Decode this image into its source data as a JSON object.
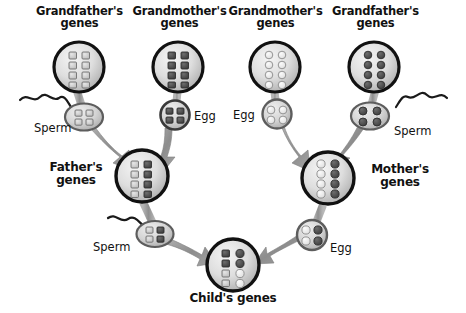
{
  "diagram": {
    "canvas": {
      "width": 466,
      "height": 313
    },
    "palette": {
      "background": "#ffffff",
      "text": "#111111",
      "cell_outline": "#111111",
      "cell_fill_light": "#d8d8d8",
      "cell_fill_mid": "#c2c2c2",
      "arrow_gray": "#9a9a9a",
      "arrow_gray_dark": "#7e7e7e",
      "gene_light": "#cccccc",
      "gene_dark": "#555555",
      "gene_white": "#f2f2f2",
      "gene_outline": "#6e6e6e",
      "tail_black": "#1a1a1a"
    }
  },
  "labels": {
    "paternal_grandfather": "Grandfather's\ngenes",
    "paternal_grandmother": "Grandmother's\ngenes",
    "maternal_grandmother": "Grandmother's\ngenes",
    "maternal_grandfather": "Grandfather's\ngenes",
    "father": "Father's\ngenes",
    "mother": "Mother's\ngenes",
    "child": "Child's genes",
    "sperm_paternal": "Sperm",
    "egg_paternal": "Egg",
    "egg_maternal": "Egg",
    "sperm_maternal": "Sperm",
    "sperm_father": "Sperm",
    "egg_mother": "Egg"
  },
  "cells": {
    "paternal_grandfather": {
      "name": "paternal-grandfather-cell",
      "shape": "square",
      "rows": 4,
      "cols": 2,
      "genes": [
        [
          "light",
          "light"
        ],
        [
          "light",
          "light"
        ],
        [
          "light",
          "light"
        ],
        [
          "light",
          "light"
        ]
      ]
    },
    "paternal_grandmother": {
      "name": "paternal-grandmother-cell",
      "shape": "square",
      "rows": 4,
      "cols": 2,
      "genes": [
        [
          "dark",
          "dark"
        ],
        [
          "dark",
          "dark"
        ],
        [
          "dark",
          "dark"
        ],
        [
          "dark",
          "dark"
        ]
      ]
    },
    "maternal_grandmother": {
      "name": "maternal-grandmother-cell",
      "shape": "circle",
      "rows": 4,
      "cols": 2,
      "genes": [
        [
          "light",
          "light"
        ],
        [
          "light",
          "light"
        ],
        [
          "light",
          "light"
        ],
        [
          "light",
          "light"
        ]
      ]
    },
    "maternal_grandfather": {
      "name": "maternal-grandfather-cell",
      "shape": "circle",
      "rows": 4,
      "cols": 2,
      "genes": [
        [
          "dark",
          "dark"
        ],
        [
          "dark",
          "dark"
        ],
        [
          "dark",
          "dark"
        ],
        [
          "dark",
          "dark"
        ]
      ]
    },
    "father": {
      "name": "father-cell",
      "shape": "square",
      "rows": 4,
      "cols": 2,
      "genes": [
        [
          "light",
          "dark"
        ],
        [
          "light",
          "dark"
        ],
        [
          "light",
          "dark"
        ],
        [
          "light",
          "dark"
        ]
      ]
    },
    "mother": {
      "name": "mother-cell",
      "shape": "circle",
      "rows": 4,
      "cols": 2,
      "genes": [
        [
          "light",
          "dark"
        ],
        [
          "light",
          "dark"
        ],
        [
          "light",
          "dark"
        ],
        [
          "light",
          "dark"
        ]
      ]
    },
    "child": {
      "name": "child-cell",
      "shape": "mixed",
      "rows": 4,
      "cols": 2,
      "col_shapes": [
        "square",
        "circle"
      ],
      "genes": [
        [
          "dark",
          "dark"
        ],
        [
          "dark",
          "dark"
        ],
        [
          "light",
          "light"
        ],
        [
          "light",
          "light"
        ]
      ]
    }
  },
  "gametes": {
    "sperm_paternal": {
      "name": "paternal-grandfather-sperm",
      "type": "sperm",
      "shape": "square",
      "tail_side": "left",
      "genes": [
        [
          "light",
          "light"
        ],
        [
          "light",
          "light"
        ]
      ]
    },
    "egg_paternal": {
      "name": "paternal-grandmother-egg",
      "type": "egg",
      "shape": "square",
      "genes": [
        [
          "dark",
          "dark"
        ],
        [
          "dark",
          "dark"
        ]
      ]
    },
    "egg_maternal": {
      "name": "maternal-grandmother-egg",
      "type": "egg",
      "shape": "circle",
      "genes": [
        [
          "light",
          "light"
        ],
        [
          "light",
          "light"
        ]
      ]
    },
    "sperm_maternal": {
      "name": "maternal-grandfather-sperm",
      "type": "sperm",
      "shape": "circle",
      "tail_side": "right",
      "genes": [
        [
          "dark",
          "dark"
        ],
        [
          "dark",
          "dark"
        ]
      ]
    },
    "sperm_father": {
      "name": "father-sperm",
      "type": "sperm",
      "shape": "square",
      "tail_side": "left",
      "genes": [
        [
          "light",
          "dark"
        ],
        [
          "light",
          "dark"
        ]
      ]
    },
    "egg_mother": {
      "name": "mother-egg",
      "type": "egg",
      "shape": "circle",
      "genes": [
        [
          "light",
          "dark"
        ],
        [
          "light",
          "dark"
        ]
      ]
    }
  },
  "flow": [
    {
      "from": "paternal_grandfather",
      "to": "sperm_paternal"
    },
    {
      "from": "paternal_grandmother",
      "to": "egg_paternal"
    },
    {
      "from": "sperm_paternal",
      "to": "father"
    },
    {
      "from": "egg_paternal",
      "to": "father"
    },
    {
      "from": "maternal_grandmother",
      "to": "egg_maternal"
    },
    {
      "from": "maternal_grandfather",
      "to": "sperm_maternal"
    },
    {
      "from": "egg_maternal",
      "to": "mother"
    },
    {
      "from": "sperm_maternal",
      "to": "mother"
    },
    {
      "from": "father",
      "to": "sperm_father"
    },
    {
      "from": "sperm_father",
      "to": "child"
    },
    {
      "from": "mother",
      "to": "egg_mother"
    },
    {
      "from": "egg_mother",
      "to": "child"
    }
  ]
}
